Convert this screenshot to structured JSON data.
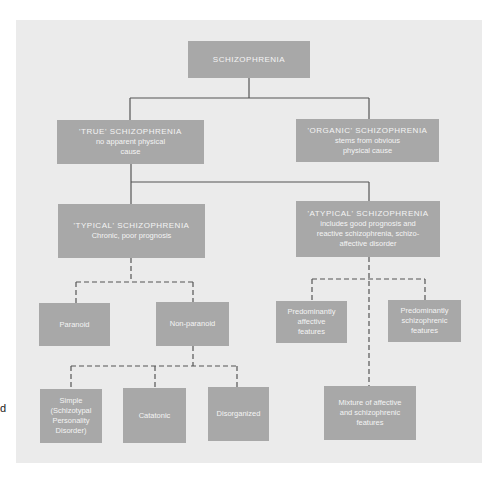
{
  "stray_text": "d",
  "colors": {
    "panel": "#ebebeb",
    "box": "#a8a8a8",
    "box_text": "#f4f4f4",
    "line": "#555555"
  },
  "diagram": {
    "root": {
      "title": "SCHIZOPHRENIA"
    },
    "true": {
      "title": "'TRUE' SCHIZOPHRENIA",
      "sub": [
        "no apparent physical",
        "cause"
      ]
    },
    "organic": {
      "title": "'ORGANIC' SCHIZOPHRENIA",
      "sub": [
        "stems from obvious",
        "physical cause"
      ]
    },
    "typical": {
      "title": "'TYPICAL' SCHIZOPHRENIA",
      "sub": [
        "Chronic, poor prognosis"
      ]
    },
    "atypical": {
      "title": "'ATYPICAL' SCHIZOPHRENIA",
      "sub": [
        "includes good prognosis and",
        "reactive schizophrenia, schizo-",
        "affective disorder"
      ]
    },
    "paranoid": {
      "lines": [
        "Paranoid"
      ]
    },
    "non_paranoid": {
      "lines": [
        "Non-paranoid"
      ]
    },
    "pred_affective": {
      "lines": [
        "Predominantly",
        "affective",
        "features"
      ]
    },
    "pred_schizophrenic": {
      "lines": [
        "Predominantly",
        "schizophrenic",
        "features"
      ]
    },
    "simple": {
      "lines": [
        "Simple",
        "(Schizotypal",
        "Personality",
        "Disorder)"
      ]
    },
    "catatonic": {
      "lines": [
        "Catatonic"
      ]
    },
    "disorganized": {
      "lines": [
        "Disorganized"
      ]
    },
    "mixture": {
      "lines": [
        "Mixture of affective",
        "and schizophrenic",
        "features"
      ]
    }
  }
}
